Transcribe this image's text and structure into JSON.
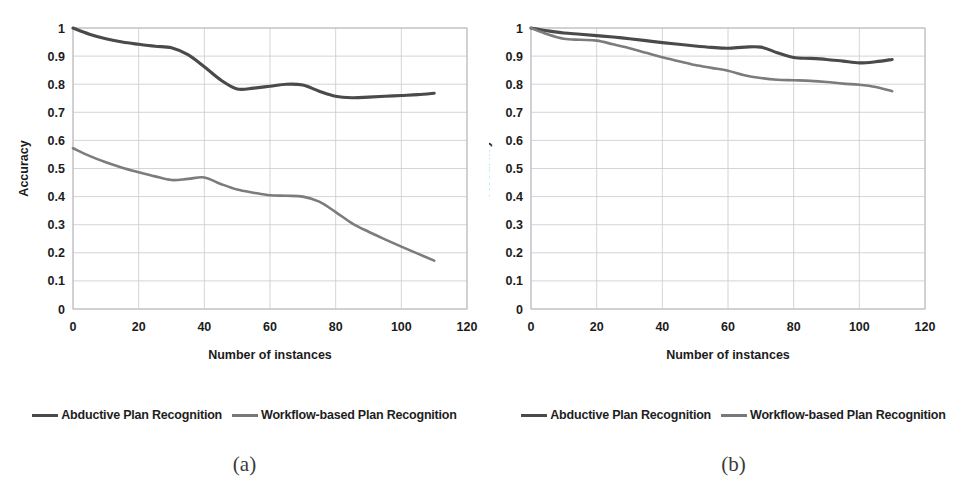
{
  "figure": {
    "panels": [
      {
        "caption": "(a)",
        "legend": [
          {
            "label": "Abductive Plan Recognition",
            "color": "#4a4a4a"
          },
          {
            "label": "Workflow-based Plan Recognition",
            "color": "#787878"
          }
        ]
      },
      {
        "caption": "(b)",
        "legend": [
          {
            "label": "Abductive Plan Recognition",
            "color": "#4a4a4a"
          },
          {
            "label": "Workflow-based Plan Recognition",
            "color": "#787878"
          }
        ]
      }
    ]
  },
  "chart_data": [
    {
      "type": "line",
      "panel": "(a)",
      "title": "",
      "xlabel": "Number of instances",
      "ylabel": "Accuracy",
      "xlim": [
        0,
        120
      ],
      "ylim": [
        0,
        1
      ],
      "xticks": [
        0,
        20,
        40,
        60,
        80,
        100,
        120
      ],
      "ytick_labels": [
        "0",
        "0.1",
        "0.2",
        "0.3",
        "0.4",
        "0.5",
        "0.6",
        "0.7",
        "0.8",
        "0.9",
        "1"
      ],
      "yticks": [
        0,
        0.1,
        0.2,
        0.3,
        0.4,
        0.5,
        0.6,
        0.7,
        0.8,
        0.9,
        1
      ],
      "grid": true,
      "legend_position": "below",
      "x": [
        0,
        5,
        10,
        15,
        20,
        25,
        30,
        35,
        40,
        45,
        50,
        55,
        60,
        65,
        70,
        75,
        80,
        85,
        90,
        95,
        100,
        105,
        110
      ],
      "series": [
        {
          "name": "Abductive Plan Recognition",
          "color": "#4a4a4a",
          "values": [
            1.0,
            0.978,
            0.962,
            0.95,
            0.942,
            0.935,
            0.93,
            0.905,
            0.862,
            0.815,
            0.783,
            0.786,
            0.793,
            0.8,
            0.797,
            0.775,
            0.757,
            0.752,
            0.754,
            0.757,
            0.76,
            0.763,
            0.768
          ]
        },
        {
          "name": "Workflow-based Plan Recognition",
          "color": "#787878",
          "values": [
            0.572,
            0.545,
            0.522,
            0.503,
            0.487,
            0.472,
            0.459,
            0.463,
            0.468,
            0.445,
            0.425,
            0.414,
            0.405,
            0.403,
            0.4,
            0.382,
            0.345,
            0.305,
            0.275,
            0.248,
            0.222,
            0.197,
            0.172
          ]
        }
      ]
    },
    {
      "type": "line",
      "panel": "(b)",
      "title": "",
      "xlabel": "Number of instances",
      "ylabel": "Accuracy",
      "xlim": [
        0,
        120
      ],
      "ylim": [
        0,
        1
      ],
      "xticks": [
        0,
        20,
        40,
        60,
        80,
        100,
        120
      ],
      "ytick_labels": [
        "0",
        "0.1",
        "0.2",
        "0.3",
        "0.4",
        "0.5",
        "0.6",
        "0.7",
        "0.8",
        "0.9",
        "1"
      ],
      "yticks": [
        0,
        0.1,
        0.2,
        0.3,
        0.4,
        0.5,
        0.6,
        0.7,
        0.8,
        0.9,
        1
      ],
      "grid": true,
      "legend_position": "below",
      "x": [
        0,
        5,
        10,
        15,
        20,
        25,
        30,
        35,
        40,
        45,
        50,
        55,
        60,
        65,
        70,
        75,
        80,
        85,
        90,
        95,
        100,
        105,
        110
      ],
      "series": [
        {
          "name": "Abductive Plan Recognition",
          "color": "#4a4a4a",
          "values": [
            1.0,
            0.99,
            0.982,
            0.978,
            0.973,
            0.968,
            0.962,
            0.955,
            0.948,
            0.942,
            0.936,
            0.931,
            0.928,
            0.932,
            0.932,
            0.912,
            0.895,
            0.892,
            0.888,
            0.882,
            0.876,
            0.88,
            0.888
          ]
        },
        {
          "name": "Workflow-based Plan Recognition",
          "color": "#787878",
          "values": [
            1.0,
            0.978,
            0.962,
            0.958,
            0.955,
            0.942,
            0.928,
            0.912,
            0.896,
            0.882,
            0.868,
            0.858,
            0.848,
            0.832,
            0.822,
            0.816,
            0.814,
            0.812,
            0.808,
            0.802,
            0.798,
            0.79,
            0.775
          ]
        }
      ]
    }
  ]
}
